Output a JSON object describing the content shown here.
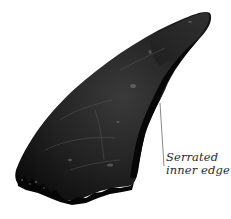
{
  "figure": {
    "subject_icon": "tooth-fossil-icon",
    "colors": {
      "background": "#ffffff",
      "tooth_dark": "#0d0d0d",
      "tooth_mid": "#2b2b2b",
      "tooth_highlight": "#5a5a5a",
      "leader_line": "#6a6a6a",
      "label_text": "#2a2a2a"
    }
  },
  "annotation": {
    "line1": "Serrated",
    "line2": "inner edge"
  }
}
